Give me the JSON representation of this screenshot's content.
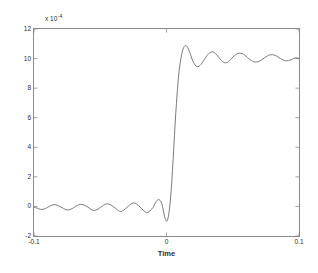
{
  "figure": {
    "background_color": "#ffffff",
    "axis_color": "#8a8a8a",
    "line_color": "#6b6b6b",
    "text_color": "#2b2b2b",
    "exponent_prefix": "x 10",
    "exponent_power": "-4"
  },
  "chart_data": {
    "type": "line",
    "title": "",
    "xlabel": "Time",
    "ylabel": "",
    "xlim": [
      -0.1,
      0.1
    ],
    "ylim": [
      -2,
      12
    ],
    "y_scale_factor": "x 10^-4",
    "grid": false,
    "legend": null,
    "xticks": [
      -0.1,
      0,
      0.1
    ],
    "xtick_labels": [
      "-0.1",
      "0",
      "0.1"
    ],
    "yticks": [
      -2,
      0,
      2,
      4,
      6,
      8,
      10,
      12
    ],
    "ytick_labels": [
      "-2",
      "0",
      "2",
      "4",
      "6",
      "8",
      "10",
      "12"
    ],
    "annotations": [],
    "series": [
      {
        "name": "step response",
        "description": "Ringing step response: low-level oscillation about 0 before t=0, sharp rise at t=0 with overshoot to ~10.9, settling toward 10 with decaying ripple.",
        "x": [
          -0.1,
          -0.0975,
          -0.095,
          -0.0925,
          -0.09,
          -0.0875,
          -0.085,
          -0.0825,
          -0.08,
          -0.0775,
          -0.075,
          -0.0725,
          -0.07,
          -0.0675,
          -0.065,
          -0.0625,
          -0.06,
          -0.0575,
          -0.055,
          -0.0525,
          -0.05,
          -0.0475,
          -0.045,
          -0.0425,
          -0.04,
          -0.0375,
          -0.035,
          -0.0325,
          -0.03,
          -0.0275,
          -0.025,
          -0.0225,
          -0.02,
          -0.0175,
          -0.015,
          -0.0125,
          -0.01,
          -0.0085,
          -0.007,
          -0.0055,
          -0.004,
          -0.003,
          -0.002,
          -0.001,
          0.0,
          0.001,
          0.002,
          0.003,
          0.004,
          0.005,
          0.006,
          0.007,
          0.008,
          0.009,
          0.01,
          0.012,
          0.014,
          0.016,
          0.018,
          0.02,
          0.023,
          0.026,
          0.029,
          0.032,
          0.035,
          0.038,
          0.041,
          0.044,
          0.047,
          0.05,
          0.054,
          0.058,
          0.062,
          0.066,
          0.07,
          0.074,
          0.078,
          0.082,
          0.086,
          0.09,
          0.094,
          0.097,
          0.1
        ],
        "y": [
          -0.05,
          -0.12,
          -0.2,
          -0.18,
          -0.08,
          0.05,
          0.12,
          0.08,
          -0.02,
          -0.15,
          -0.24,
          -0.2,
          -0.08,
          0.06,
          0.14,
          0.1,
          -0.01,
          -0.16,
          -0.28,
          -0.22,
          -0.08,
          0.08,
          0.18,
          0.12,
          -0.02,
          -0.2,
          -0.34,
          -0.26,
          -0.08,
          0.12,
          0.24,
          0.16,
          -0.04,
          -0.26,
          -0.42,
          -0.3,
          -0.05,
          0.22,
          0.42,
          0.45,
          0.3,
          0.0,
          -0.45,
          -0.82,
          -1.0,
          -0.85,
          -0.35,
          0.5,
          1.7,
          3.2,
          4.8,
          6.3,
          7.6,
          8.7,
          9.5,
          10.5,
          10.88,
          10.75,
          10.3,
          9.8,
          9.45,
          9.6,
          10.0,
          10.35,
          10.45,
          10.25,
          9.9,
          9.72,
          9.8,
          10.1,
          10.35,
          10.3,
          10.0,
          9.78,
          9.82,
          10.05,
          10.25,
          10.22,
          10.0,
          9.85,
          9.92,
          10.05,
          10.0
        ]
      }
    ]
  }
}
